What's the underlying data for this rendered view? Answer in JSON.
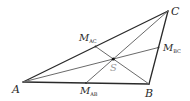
{
  "diagram": {
    "type": "triangle-medians-centroid",
    "colors": {
      "edges": "#2a2a2a",
      "medians": "#6a6a6a",
      "centroid_label": "#9a9a9a",
      "background": "#ffffff"
    },
    "vertices": {
      "A": {
        "label": "A",
        "x": 23,
        "y": 82
      },
      "B": {
        "label": "B",
        "x": 149,
        "y": 84
      },
      "C": {
        "label": "C",
        "x": 168,
        "y": 11
      }
    },
    "midpoints": {
      "AB": {
        "label": "M",
        "sub": "AB",
        "x": 86,
        "y": 83
      },
      "AC": {
        "label": "M",
        "sub": "AC",
        "x": 95.5,
        "y": 46.5
      },
      "BC": {
        "label": "M",
        "sub": "BC",
        "x": 158.5,
        "y": 47.5
      }
    },
    "centroid": {
      "label": "S",
      "x": 113.3,
      "y": 59
    }
  }
}
